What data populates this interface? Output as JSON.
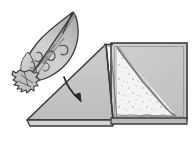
{
  "figure": {
    "type": "line-drawing",
    "title": "Leaf folding into triangular prism diagram",
    "caption": "",
    "background_color": "#ffffff",
    "width": 193,
    "height": 143
  },
  "palette": {
    "ink": "#3a3a3a",
    "ink_soft": "#5c5c5c",
    "outline": "#2e2e2e",
    "leaf_fill": "#c9c9c9",
    "leaf_fill_light": "#d8d8d8",
    "leaf_shade": "#9a9a9a",
    "prism_face_fill": "#c4c4c4",
    "prism_side_fill": "#c0c0c0",
    "panel_fill": "#c9c9c9",
    "speckle_fill": "#f2f2f2",
    "speckle_dot": "#b9b9b9",
    "edge_dark": "#4a4a4a",
    "white": "#ffffff"
  },
  "objects": {
    "leaf": {
      "label": "leaf",
      "description": "Shaded leaf with pointed tip at upper right and frayed stem base at lower left",
      "vein_count": 5,
      "tip_position": "upper-right",
      "base_position": "lower-left"
    },
    "arrow": {
      "label": "fold arrow",
      "description": "Curved arrow pointing down and to the right",
      "direction": "down-right",
      "style": "curved"
    },
    "prism": {
      "label": "triangular prism",
      "description": "Tent-shaped triangular prism: large triangular face on the left, square end panel on the right",
      "faces": [
        {
          "name": "triangular-face",
          "fill": "#c4c4c4"
        },
        {
          "name": "end-panel",
          "fill": "#c9c9c9"
        },
        {
          "name": "speckled-insert",
          "fill": "#f2f2f2"
        }
      ]
    }
  }
}
